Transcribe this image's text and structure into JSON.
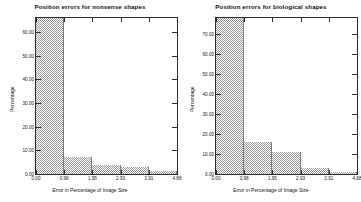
{
  "figure": {
    "background": "#ffffff",
    "bar_color": "#9a9a9a",
    "axis_color": "#2b2b2b"
  },
  "chart_data": [
    {
      "type": "bar",
      "title": "Position errors for nonsense shapes",
      "xlabel": "Error in Percentage of Image Size",
      "ylabel": "Percentage",
      "categories": [
        "0.00",
        "0.98",
        "1.95",
        "2.93",
        "3.91",
        "4.88"
      ],
      "xticklabels": [
        "0.00",
        "0.98",
        "1.95",
        "2.93",
        "3.91",
        "4.88"
      ],
      "yticklabels": [
        "0.00",
        "10.00",
        "20.00",
        "30.00",
        "40.00",
        "50.00",
        "60.00"
      ],
      "values": [
        66.0,
        7.0,
        4.0,
        3.0,
        1.2
      ],
      "xlim": [
        0.0,
        4.88
      ],
      "ylim": [
        0,
        66
      ],
      "grid": false,
      "legend": "none"
    },
    {
      "type": "bar",
      "title": "Position errors for biological shapes",
      "xlabel": "Error in Percentage of Image Size",
      "ylabel": "Percentage",
      "categories": [
        "0.00",
        "0.98",
        "1.95",
        "2.93",
        "3.91",
        "4.88"
      ],
      "xticklabels": [
        "0.00",
        "0.98",
        "1.95",
        "2.93",
        "3.91",
        "4.88"
      ],
      "yticklabels": [
        "0.00",
        "10.00",
        "20.00",
        "30.00",
        "40.00",
        "50.00",
        "60.00",
        "70.00"
      ],
      "values": [
        78.0,
        16.0,
        11.0,
        3.0,
        1.2
      ],
      "xlim": [
        0.0,
        4.88
      ],
      "ylim": [
        0,
        78
      ],
      "grid": false,
      "legend": "none"
    }
  ]
}
